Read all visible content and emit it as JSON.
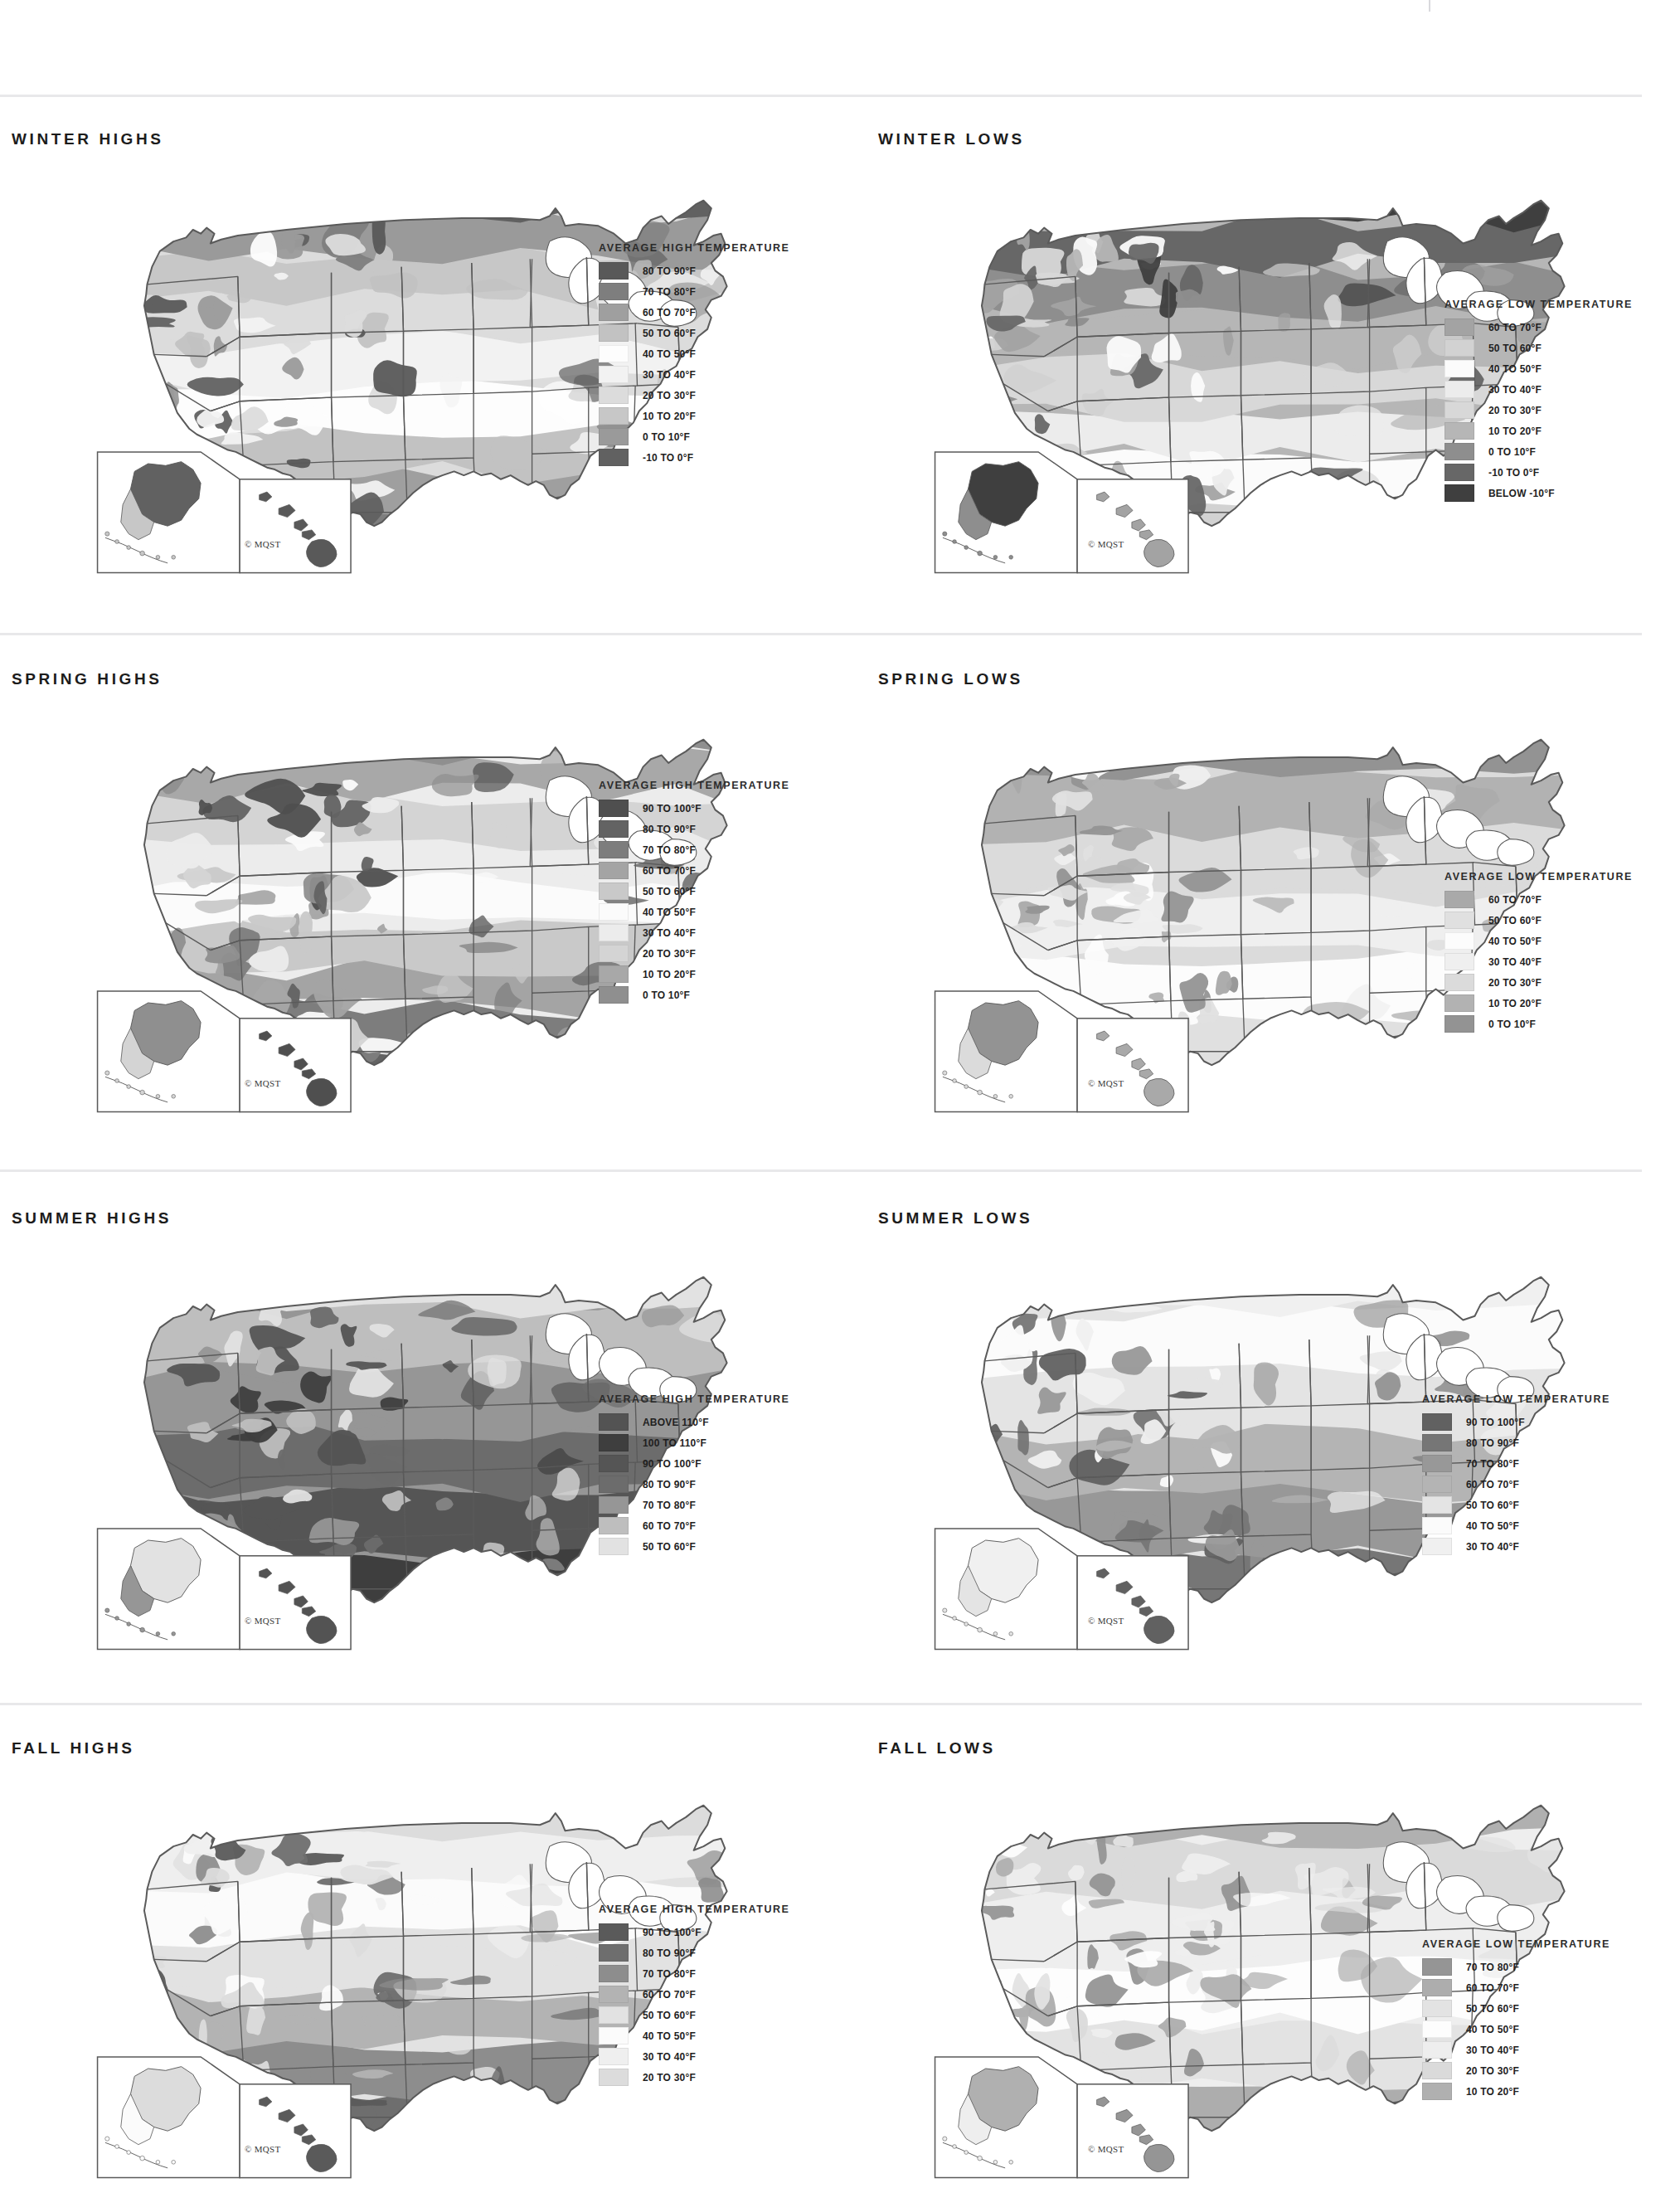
{
  "meta": {
    "credit": "© MQST",
    "legend_title_high": "AVERAGE HIGH TEMPERATURE",
    "legend_title_low": "AVERAGE LOW TEMPERATURE"
  },
  "palette": {
    "band_10": "#4a4a4a",
    "band_9": "#5d5d5d",
    "band_8": "#6f6f6f",
    "band_7": "#838383",
    "band_6": "#9a9a9a",
    "band_5": "#b0b0b0",
    "band_4": "#c4c4c4",
    "band_3": "#d7d7d7",
    "band_2": "#e6e6e6",
    "band_1": "#f2f2f2",
    "band_0": "#fbfbfb",
    "outline": "#5a5a5a",
    "rule": "#e8e8ea"
  },
  "chart_data": {
    "type": "map",
    "panels": [
      {
        "id": "winter-highs",
        "title": "WINTER HIGHS",
        "legend_title": "AVERAGE HIGH TEMPERATURE",
        "legend": [
          {
            "label": "80 TO 90°F",
            "color": "#595959"
          },
          {
            "label": "70 TO 80°F",
            "color": "#7e7e7e"
          },
          {
            "label": "60 TO 70°F",
            "color": "#9f9f9f"
          },
          {
            "label": "50 TO 60°F",
            "color": "#c2c2c2"
          },
          {
            "label": "40 TO 50°F",
            "color": "#fdfdfd"
          },
          {
            "label": "30 TO 40°F",
            "color": "#f2f2f2"
          },
          {
            "label": "20 TO 30°F",
            "color": "#dcdcdc"
          },
          {
            "label": "10 TO 20°F",
            "color": "#c7c7c7"
          },
          {
            "label": "0 TO 10°F",
            "color": "#9a9a9a"
          },
          {
            "label": "-10 TO 0°F",
            "color": "#616161"
          }
        ]
      },
      {
        "id": "winter-lows",
        "title": "WINTER LOWS",
        "legend_title": "AVERAGE LOW TEMPERATURE",
        "legend": [
          {
            "label": "60 TO 70°F",
            "color": "#a3a3a3"
          },
          {
            "label": "50 TO 60°F",
            "color": "#d2d2d2"
          },
          {
            "label": "40 TO 50°F",
            "color": "#fbfbfb"
          },
          {
            "label": "30 TO 40°F",
            "color": "#ececec"
          },
          {
            "label": "20 TO 30°F",
            "color": "#d8d8d8"
          },
          {
            "label": "10 TO 20°F",
            "color": "#b6b6b6"
          },
          {
            "label": "0 TO 10°F",
            "color": "#8e8e8e"
          },
          {
            "label": "-10 TO 0°F",
            "color": "#676767"
          },
          {
            "label": "BELOW -10°F",
            "color": "#3f3f3f"
          }
        ]
      },
      {
        "id": "spring-highs",
        "title": "SPRING HIGHS",
        "legend_title": "AVERAGE HIGH TEMPERATURE",
        "legend": [
          {
            "label": "90 TO 100°F",
            "color": "#4f4f4f"
          },
          {
            "label": "80 TO 90°F",
            "color": "#636363"
          },
          {
            "label": "70 TO 80°F",
            "color": "#7d7d7d"
          },
          {
            "label": "60 TO 70°F",
            "color": "#a4a4a4"
          },
          {
            "label": "50 TO 60°F",
            "color": "#c9c9c9"
          },
          {
            "label": "40 TO 50°F",
            "color": "#fbfbfb"
          },
          {
            "label": "30 TO 40°F",
            "color": "#ececec"
          },
          {
            "label": "20 TO 30°F",
            "color": "#d4d4d4"
          },
          {
            "label": "10 TO 20°F",
            "color": "#a8a8a8"
          },
          {
            "label": "0 TO 10°F",
            "color": "#8f8f8f"
          }
        ]
      },
      {
        "id": "spring-lows",
        "title": "SPRING LOWS",
        "legend_title": "AVERAGE LOW TEMPERATURE",
        "legend": [
          {
            "label": "60 TO 70°F",
            "color": "#a9a9a9"
          },
          {
            "label": "50 TO 60°F",
            "color": "#e0e0e0"
          },
          {
            "label": "40 TO 50°F",
            "color": "#fcfcfc"
          },
          {
            "label": "30 TO 40°F",
            "color": "#efefef"
          },
          {
            "label": "20 TO 30°F",
            "color": "#dbdbdb"
          },
          {
            "label": "10 TO 20°F",
            "color": "#b2b2b2"
          },
          {
            "label": "0 TO 10°F",
            "color": "#939393"
          }
        ]
      },
      {
        "id": "summer-highs",
        "title": "SUMMER HIGHS",
        "legend_title": "AVERAGE HIGH TEMPERATURE",
        "legend": [
          {
            "label": "ABOVE 110°F",
            "color": "#535353"
          },
          {
            "label": "100 TO 110°F",
            "color": "#3e3e3e"
          },
          {
            "label": "90 TO 100°F",
            "color": "#555555"
          },
          {
            "label": "80 TO 90°F",
            "color": "#6c6c6c"
          },
          {
            "label": "70 TO 80°F",
            "color": "#969696"
          },
          {
            "label": "60 TO 70°F",
            "color": "#bebebe"
          },
          {
            "label": "50 TO 60°F",
            "color": "#e2e2e2"
          }
        ]
      },
      {
        "id": "summer-lows",
        "title": "SUMMER LOWS",
        "legend_title": "AVERAGE LOW TEMPERATURE",
        "legend": [
          {
            "label": "90 TO 100°F",
            "color": "#616161"
          },
          {
            "label": "80 TO 90°F",
            "color": "#767676"
          },
          {
            "label": "70 TO 80°F",
            "color": "#989898"
          },
          {
            "label": "60 TO 70°F",
            "color": "#b4b4b4"
          },
          {
            "label": "50 TO 60°F",
            "color": "#e4e4e4"
          },
          {
            "label": "40 TO 50°F",
            "color": "#fbfbfb"
          },
          {
            "label": "30 TO 40°F",
            "color": "#f0f0f0"
          }
        ]
      },
      {
        "id": "fall-highs",
        "title": "FALL HIGHS",
        "legend_title": "AVERAGE HIGH TEMPERATURE",
        "legend": [
          {
            "label": "90 TO 100°F",
            "color": "#5a5a5a"
          },
          {
            "label": "80 TO 90°F",
            "color": "#6e6e6e"
          },
          {
            "label": "70 TO 80°F",
            "color": "#8d8d8d"
          },
          {
            "label": "60 TO 70°F",
            "color": "#b3b3b3"
          },
          {
            "label": "50 TO 60°F",
            "color": "#e2e2e2"
          },
          {
            "label": "40 TO 50°F",
            "color": "#fbfbfb"
          },
          {
            "label": "30 TO 40°F",
            "color": "#efefef"
          },
          {
            "label": "20 TO 30°F",
            "color": "#dcdcdc"
          }
        ]
      },
      {
        "id": "fall-lows",
        "title": "FALL LOWS",
        "legend_title": "AVERAGE LOW TEMPERATURE",
        "legend": [
          {
            "label": "70 TO 80°F",
            "color": "#959595"
          },
          {
            "label": "60 TO 70°F",
            "color": "#adadad"
          },
          {
            "label": "50 TO 60°F",
            "color": "#e3e3e3"
          },
          {
            "label": "40 TO 50°F",
            "color": "#fdfdfd"
          },
          {
            "label": "30 TO 40°F",
            "color": "#eeeeee"
          },
          {
            "label": "20 TO 30°F",
            "color": "#dadada"
          },
          {
            "label": "10 TO 20°F",
            "color": "#b0b0b0"
          }
        ]
      }
    ]
  }
}
